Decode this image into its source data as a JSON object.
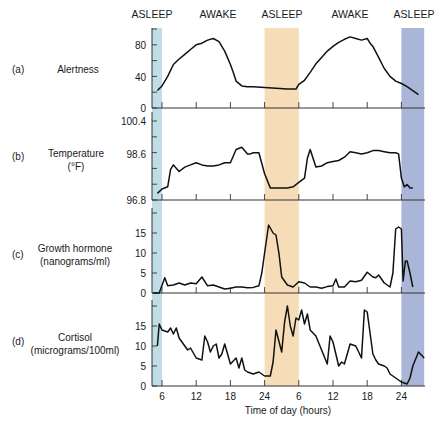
{
  "states": [
    {
      "label": "ASLEEP",
      "x": 152
    },
    {
      "label": "AWAKE",
      "x": 218
    },
    {
      "label": "ASLEEP",
      "x": 282
    },
    {
      "label": "AWAKE",
      "x": 350
    },
    {
      "label": "ASLEEP",
      "x": 414
    }
  ],
  "bands": [
    {
      "state": "ASLEEP",
      "from_hour": 4.25,
      "to_hour": 6,
      "color": "#bedde5"
    },
    {
      "state": "ASLEEP",
      "from_hour": 24,
      "to_hour": 30,
      "color": "#f6ddb8"
    },
    {
      "state": "ASLEEP",
      "from_hour": 48,
      "to_hour": 52,
      "color": "#a9b6d8"
    }
  ],
  "xaxis": {
    "label": "Time of day (hours)",
    "ticks": [
      {
        "label": "6",
        "hour": 6
      },
      {
        "label": "12",
        "hour": 12
      },
      {
        "label": "18",
        "hour": 18
      },
      {
        "label": "24",
        "hour": 24
      },
      {
        "label": "6",
        "hour": 30
      },
      {
        "label": "12",
        "hour": 36
      },
      {
        "label": "18",
        "hour": 42
      },
      {
        "label": "24",
        "hour": 48
      }
    ]
  },
  "chart_data": [
    {
      "type": "line",
      "panel": "(a)",
      "title": "Alertness",
      "xlabel": "Time of day (hours)",
      "ylabel": "Alertness",
      "ylim": [
        0,
        100
      ],
      "yticks": [
        "0",
        "40",
        "80"
      ],
      "x": [
        5.2,
        6,
        7,
        8,
        9,
        10,
        11,
        12,
        13,
        14,
        15,
        16,
        17,
        18,
        18.5,
        19,
        20,
        21,
        22,
        24,
        26,
        28,
        29.5,
        30,
        31,
        32,
        33,
        34,
        35,
        36,
        37,
        38,
        39,
        40,
        41,
        42,
        42.5,
        43,
        44,
        45,
        46,
        47,
        48,
        49,
        50,
        51
      ],
      "y": [
        22,
        28,
        40,
        55,
        62,
        68,
        74,
        80,
        82,
        86,
        88,
        84,
        72,
        55,
        45,
        34,
        28,
        27,
        27,
        26,
        25,
        24,
        24,
        30,
        35,
        45,
        56,
        64,
        72,
        78,
        83,
        87,
        90,
        88,
        86,
        88,
        82,
        78,
        64,
        50,
        40,
        34,
        31,
        27,
        22,
        17
      ]
    },
    {
      "type": "line",
      "panel": "(b)",
      "title": "Temperature (°F)",
      "ylabel": "Temperature (°F)",
      "ylim": [
        96.8,
        100.4
      ],
      "yticks": [
        "96.8",
        "98.6",
        "100.4"
      ],
      "x": [
        5.2,
        6,
        7,
        7.5,
        8,
        9,
        10,
        11,
        12,
        13,
        14,
        15,
        16,
        17,
        18,
        19,
        20,
        21,
        21.5,
        22,
        23,
        24,
        25,
        26,
        27,
        28,
        29,
        30,
        31,
        31.5,
        32,
        33,
        34,
        35,
        36,
        37,
        38,
        39,
        40,
        41,
        42,
        43,
        44,
        45,
        46,
        47,
        47.5,
        48,
        48.5,
        49,
        49.5,
        50
      ],
      "y": [
        97.1,
        97.3,
        97.4,
        98.2,
        98.4,
        98.1,
        98.3,
        98.4,
        98.5,
        98.4,
        98.35,
        98.35,
        98.4,
        98.5,
        98.5,
        99.1,
        99.2,
        98.9,
        98.9,
        98.95,
        98.95,
        98.0,
        97.35,
        97.35,
        97.35,
        97.35,
        97.4,
        97.6,
        97.8,
        98.7,
        99.1,
        98.3,
        98.35,
        98.5,
        98.55,
        98.6,
        98.75,
        99.0,
        98.95,
        98.9,
        98.95,
        99.05,
        99.05,
        99.0,
        98.95,
        98.95,
        98.9,
        97.8,
        97.4,
        97.5,
        97.35,
        97.35
      ]
    },
    {
      "type": "line",
      "panel": "(c)",
      "title": "Growth hormone (nanograms/ml)",
      "ylabel": "Growth hormone (nanograms/ml)",
      "ylim": [
        0,
        17
      ],
      "yticks": [
        "0",
        "5",
        "10",
        "15"
      ],
      "x": [
        4.5,
        5.5,
        6.5,
        7,
        8,
        9,
        10,
        11,
        12,
        13,
        14,
        15,
        16,
        17,
        18,
        19,
        20,
        21,
        22,
        23,
        23.5,
        24,
        24.7,
        25.5,
        26,
        26.5,
        27,
        28,
        29,
        30,
        31,
        32,
        33,
        34,
        35,
        36,
        36.5,
        37,
        38,
        39,
        40,
        41,
        42,
        43,
        43.5,
        44,
        45,
        46,
        46.5,
        47,
        47.5,
        48,
        48.3,
        48.7,
        49,
        49.5,
        50
      ],
      "y": [
        0,
        0,
        3.8,
        1.8,
        2,
        2.5,
        2,
        2.5,
        2.3,
        4,
        1.8,
        2,
        1.5,
        1,
        1.2,
        1.5,
        1.5,
        1.3,
        1.4,
        1.8,
        5,
        10,
        17,
        15,
        14.5,
        10,
        4,
        2,
        1.5,
        2.8,
        2.5,
        1.5,
        1.5,
        1.2,
        1.6,
        1.8,
        3.5,
        1.5,
        1.5,
        3,
        2.8,
        3.2,
        5.2,
        4,
        3.8,
        4.5,
        2.5,
        1.5,
        5,
        16,
        16.5,
        16,
        3,
        8,
        8,
        5,
        1.5
      ]
    },
    {
      "type": "line",
      "panel": "(d)",
      "title": "Cortisol (micrograms/100ml)",
      "ylabel": "Cortisol (micrograms/100ml)",
      "ylim": [
        0,
        20
      ],
      "yticks": [
        "0",
        "5",
        "10",
        "15"
      ],
      "xlabel": "Time of day (hours)",
      "x": [
        5.2,
        5.5,
        6,
        7,
        7.5,
        8,
        8.5,
        9,
        10,
        10.5,
        11,
        12,
        13,
        13.5,
        14,
        14.5,
        15,
        15.5,
        16,
        16.5,
        17,
        17.5,
        18,
        19,
        19.5,
        20,
        20.5,
        21,
        22,
        23,
        24,
        25,
        25.5,
        26,
        27,
        27.5,
        28,
        28.5,
        29,
        29.5,
        30,
        30.5,
        31,
        31.5,
        32,
        33,
        34,
        35,
        35.5,
        36,
        37,
        37.5,
        38,
        39,
        40,
        41,
        41.5,
        42,
        43,
        43.5,
        44,
        45,
        45.5,
        46,
        47,
        48,
        49,
        49.5,
        50,
        51,
        52
      ],
      "y": [
        10,
        15.5,
        14,
        13.5,
        14.5,
        13,
        14.5,
        12,
        10,
        9,
        9.5,
        7,
        6.5,
        12.5,
        11,
        8.5,
        10,
        10.5,
        7,
        8,
        10.5,
        8,
        5.5,
        7,
        4.5,
        7,
        4,
        3.5,
        3,
        3.5,
        2.5,
        2.5,
        6,
        14,
        8.5,
        16,
        20,
        15,
        12.5,
        17,
        16.5,
        19,
        15.5,
        18,
        14,
        12.5,
        9,
        5.5,
        12.5,
        11,
        5,
        6,
        5.5,
        10.5,
        10,
        7,
        19,
        18.5,
        8,
        6.5,
        5.5,
        5,
        4.5,
        3,
        2,
        1,
        0.5,
        2,
        5,
        8.5,
        7
      ]
    }
  ],
  "panels": [
    {
      "letter": "(a)",
      "name_line1": "Alertness",
      "name_line2": ""
    },
    {
      "letter": "(b)",
      "name_line1": "Temperature",
      "name_line2": "(°F)"
    },
    {
      "letter": "(c)",
      "name_line1": "Growth hormone",
      "name_line2": "(nanograms/ml)"
    },
    {
      "letter": "(d)",
      "name_line1": "Cortisol",
      "name_line2": "(micrograms/100ml)"
    }
  ]
}
